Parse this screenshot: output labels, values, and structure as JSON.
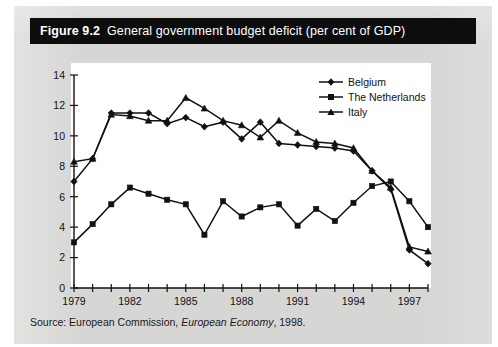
{
  "figure": {
    "label": "Figure 9.2",
    "title": "General government budget deficit (per cent of GDP)",
    "source_prefix": "Source: European Commission,",
    "source_italic": "European Economy",
    "source_suffix": ", 1998."
  },
  "legend": {
    "position": "top-right",
    "items": [
      {
        "label": "Belgium",
        "marker": "diamond"
      },
      {
        "label": "The Netherlands",
        "marker": "square"
      },
      {
        "label": "Italy",
        "marker": "triangle"
      }
    ]
  },
  "axes": {
    "y_ticks": [
      "0",
      "2",
      "4",
      "6",
      "8",
      "10",
      "12",
      "14"
    ],
    "x_ticks_labeled": [
      "1979",
      "1982",
      "1985",
      "1988",
      "1991",
      "1994",
      "1997"
    ]
  },
  "chart_data": {
    "type": "line",
    "title": "General government budget deficit (per cent of GDP)",
    "xlabel": "",
    "ylabel": "",
    "ylim": [
      0,
      14
    ],
    "xlim": [
      1979,
      1998
    ],
    "grid": false,
    "legend_position": "top-right",
    "x": [
      1979,
      1980,
      1981,
      1982,
      1983,
      1984,
      1985,
      1986,
      1987,
      1988,
      1989,
      1990,
      1991,
      1992,
      1993,
      1994,
      1995,
      1996,
      1997,
      1998
    ],
    "series": [
      {
        "name": "Belgium",
        "marker": "diamond",
        "values": [
          7.0,
          8.5,
          11.5,
          11.5,
          11.5,
          10.8,
          11.2,
          10.6,
          10.9,
          9.8,
          10.9,
          9.5,
          9.4,
          9.3,
          9.2,
          9.0,
          7.7,
          6.5,
          2.5,
          1.6
        ]
      },
      {
        "name": "The Netherlands",
        "marker": "square",
        "values": [
          3.0,
          4.2,
          5.5,
          6.6,
          6.2,
          5.8,
          5.5,
          3.5,
          5.7,
          4.7,
          5.3,
          5.5,
          4.1,
          5.2,
          4.4,
          5.6,
          6.7,
          7.0,
          5.7,
          4.0
        ]
      },
      {
        "name": "Italy",
        "marker": "triangle",
        "values": [
          8.3,
          8.5,
          11.4,
          11.3,
          11.0,
          11.0,
          12.5,
          11.8,
          11.0,
          10.7,
          9.9,
          11.0,
          10.2,
          9.6,
          9.5,
          9.2,
          7.7,
          6.6,
          2.7,
          2.4
        ]
      }
    ]
  }
}
